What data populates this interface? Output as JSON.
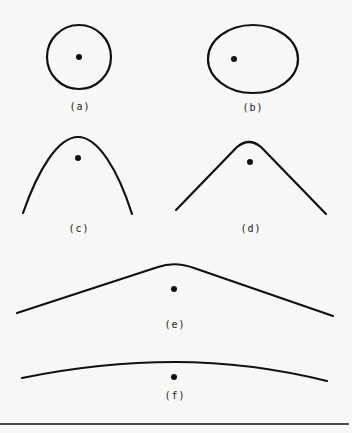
{
  "figure": {
    "panels": [
      {
        "id": "a",
        "label": "(a)",
        "shape": "circle",
        "description": "circle with focus at center"
      },
      {
        "id": "b",
        "label": "(b)",
        "shape": "ellipse",
        "description": "ellipse with focus offset left"
      },
      {
        "id": "c",
        "label": "(c)",
        "shape": "parabola",
        "description": "narrow open curve with focus inside"
      },
      {
        "id": "d",
        "label": "(d)",
        "shape": "hyperbola",
        "description": "open curve with straighter arms"
      },
      {
        "id": "e",
        "label": "(e)",
        "shape": "hyperbola-wide",
        "description": "wide open curve with focus below vertex"
      },
      {
        "id": "f",
        "label": "(f)",
        "shape": "hyperbola-flat",
        "description": "nearly flat curve with focus below"
      }
    ]
  },
  "colors": {
    "background": "#f7f7f5",
    "ink": "#111111"
  }
}
